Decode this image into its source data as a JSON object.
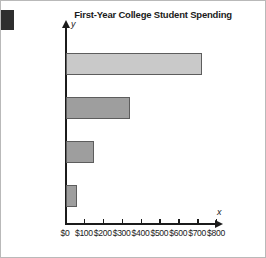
{
  "chart_data": {
    "type": "bar",
    "orientation": "horizontal",
    "title": "First-Year College Student Spending",
    "xlabel": "x",
    "ylabel": "y",
    "categories": [
      "Electronics",
      "Dorm decor",
      "Clothing",
      "Shoes"
    ],
    "values": [
      720,
      340,
      150,
      60
    ],
    "xlim": [
      0,
      800
    ],
    "xticks": [
      0,
      100,
      200,
      300,
      400,
      500,
      600,
      700,
      800
    ],
    "xtick_labels": [
      "$0",
      "$100",
      "$200",
      "$300",
      "$400",
      "$500",
      "$600",
      "$700",
      "$800"
    ],
    "grid": false,
    "legend": false,
    "bar_colors": [
      "#c9c9c9",
      "#9e9e9e",
      "#9e9e9e",
      "#9e9e9e"
    ],
    "bar_edge_color": "#5d5d5d",
    "axis_color": "#1b1b1b"
  }
}
